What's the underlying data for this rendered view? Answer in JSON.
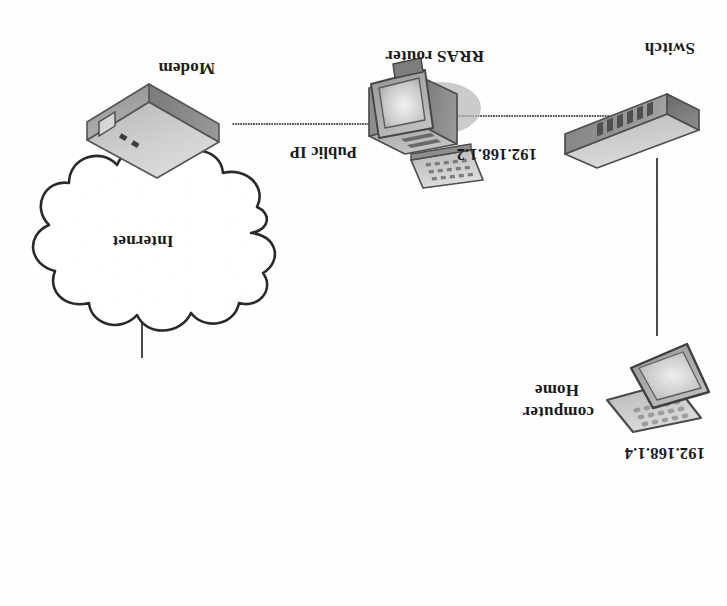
{
  "diagram": {
    "orientation": "rotated-180",
    "colors": {
      "line": "#4a4a4a",
      "text": "#1b1b1b",
      "device_light": "#d8d8d8",
      "device_mid": "#b4b4b4",
      "device_dark": "#8a8a8a",
      "outline": "#5a5a5a",
      "background": "#fefefe"
    },
    "nodes": [
      {
        "id": "internet",
        "icon": "cloud-icon",
        "label": "Internet",
        "label_position": "inside"
      },
      {
        "id": "modem",
        "icon": "modem-icon",
        "label": "Modem",
        "label_position": "above"
      },
      {
        "id": "rras-router",
        "icon": "server-computer-icon",
        "label": "RRAS router",
        "label_position": "above",
        "left_annotation": "Public IP",
        "right_annotation": "192.168.1.2"
      },
      {
        "id": "switch",
        "icon": "switch-icon",
        "label": "Switch",
        "label_position": "above"
      },
      {
        "id": "home-computer",
        "icon": "laptop-icon",
        "label": "Home computer",
        "label_line_1": "Home",
        "label_line_2": "computer",
        "label_position": "left",
        "address": "192.168.1.4"
      }
    ],
    "links": [
      {
        "id": "link-internet-modem",
        "from": "internet",
        "to": "modem",
        "style": "solid"
      },
      {
        "id": "link-modem-router",
        "from": "modem",
        "to": "rras-router",
        "style": "dotted"
      },
      {
        "id": "link-router-switch",
        "from": "rras-router",
        "to": "switch",
        "style": "dotted"
      },
      {
        "id": "link-switch-computer",
        "from": "switch",
        "to": "home-computer",
        "style": "solid"
      }
    ]
  }
}
